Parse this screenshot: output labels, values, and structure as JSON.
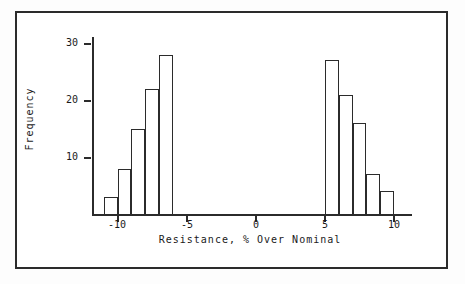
{
  "chart_data": {
    "type": "bar",
    "title": "",
    "subtitle": "",
    "xlabel": "Resistance, % Over Nominal",
    "ylabel": "Frequency",
    "xlim": [
      -12,
      12
    ],
    "ylim": [
      0,
      32
    ],
    "xticks": [
      -10,
      -5,
      0,
      5,
      10
    ],
    "xtick_labels": [
      "-10",
      "-5",
      "0",
      "5",
      "10"
    ],
    "yticks": [
      10,
      20,
      30
    ],
    "ytick_labels": [
      "10",
      "20",
      "30"
    ],
    "grid": false,
    "legend": null,
    "bin_width": 1,
    "bins": [
      {
        "x0": -11,
        "x1": -10,
        "value": 3
      },
      {
        "x0": -10,
        "x1": -9,
        "value": 8
      },
      {
        "x0": -9,
        "x1": -8,
        "value": 15
      },
      {
        "x0": -8,
        "x1": -7,
        "value": 22
      },
      {
        "x0": -7,
        "x1": -6,
        "value": 28
      },
      {
        "x0": 5,
        "x1": 6,
        "value": 27
      },
      {
        "x0": 6,
        "x1": 7,
        "value": 21
      },
      {
        "x0": 7,
        "x1": 8,
        "value": 16
      },
      {
        "x0": 8,
        "x1": 9,
        "value": 7
      },
      {
        "x0": 9,
        "x1": 10,
        "value": 4
      }
    ],
    "categories": [
      "-11 to -10",
      "-10 to -9",
      "-9 to -8",
      "-8 to -7",
      "-7 to -6",
      "5 to 6",
      "6 to 7",
      "7 to 8",
      "8 to 9",
      "9 to 10"
    ],
    "values": [
      3,
      8,
      15,
      22,
      28,
      27,
      21,
      16,
      7,
      4
    ],
    "colors": {
      "bar_fill": "#ffffff",
      "bar_edge": "#2b2b2b",
      "axis": "#2b2b2b",
      "background": "#ffffff"
    }
  }
}
